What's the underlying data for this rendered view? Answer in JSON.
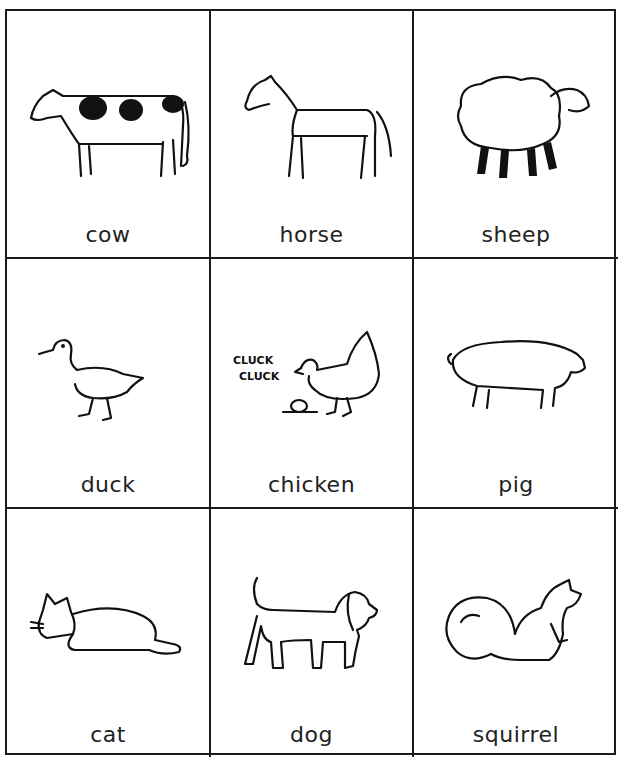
{
  "cards": [
    {
      "label": "cow",
      "icon": "cow-icon"
    },
    {
      "label": "horse",
      "icon": "horse-icon"
    },
    {
      "label": "sheep",
      "icon": "sheep-icon"
    },
    {
      "label": "duck",
      "icon": "duck-icon"
    },
    {
      "label": "chicken",
      "icon": "chicken-icon",
      "sound_text": [
        "CLUCK",
        "CLUCK"
      ]
    },
    {
      "label": "pig",
      "icon": "pig-icon"
    },
    {
      "label": "cat",
      "icon": "cat-icon"
    },
    {
      "label": "dog",
      "icon": "dog-icon"
    },
    {
      "label": "squirrel",
      "icon": "squirrel-icon"
    }
  ]
}
